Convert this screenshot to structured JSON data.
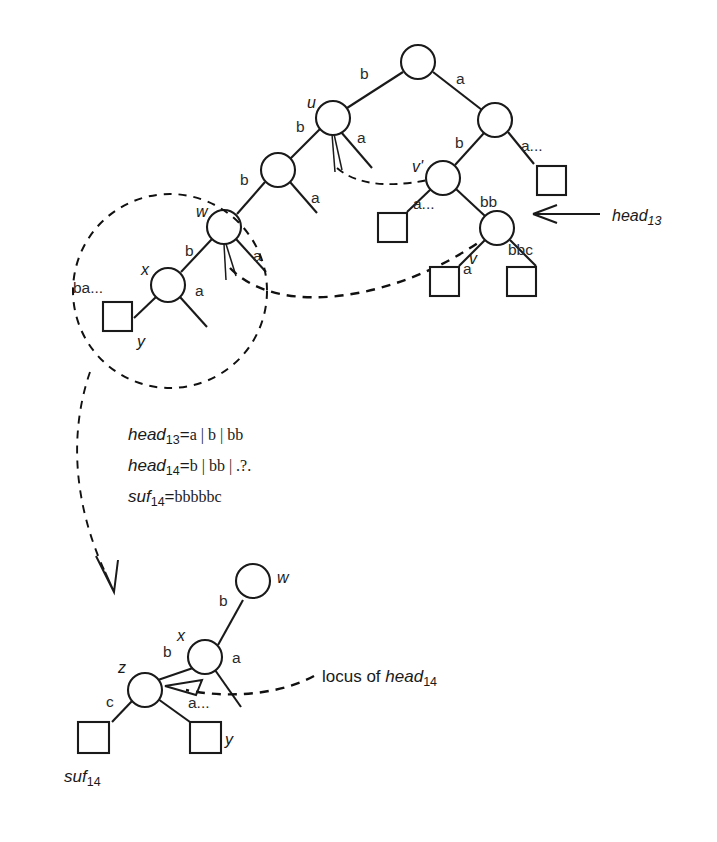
{
  "figure": {
    "background": "#ffffff",
    "ink": "#1a1a1a"
  },
  "upper_tree": {
    "node_labels": {
      "u": "u",
      "w": "w",
      "v_prime": "v'",
      "v": "v",
      "x": "x",
      "y": "y"
    },
    "edge_labels": {
      "root_left": "b",
      "root_right": "a",
      "u_left": "b",
      "u_right": "a",
      "mid_left": "b",
      "mid_right": "a",
      "w_left": "b",
      "w_right": "a",
      "x_left": "ba...",
      "x_right": "a",
      "right_child_left": "b",
      "right_child_right": "a...",
      "vprime_left": "a...",
      "vprime_right": "bb",
      "v_left": "a",
      "v_right": "bbc"
    }
  },
  "annotations": {
    "head13_arrow_label_name": "head",
    "head13_arrow_label_sub": "13",
    "locus_prefix": "locus of ",
    "locus_name": "head",
    "locus_sub": "14"
  },
  "formulas": [
    {
      "name": "head",
      "sub": "13",
      "eq": "=",
      "value": "a | b | bb"
    },
    {
      "name": "head",
      "sub": "14",
      "eq": "=",
      "value": "b | bb | .?."
    },
    {
      "name": "suf",
      "sub": "14",
      "eq": "=",
      "value": "bbbbbc"
    }
  ],
  "lower_tree": {
    "node_labels": {
      "w": "w",
      "x": "x",
      "z": "z",
      "y": "y"
    },
    "edge_labels": {
      "x_to_w": "b",
      "x_left": "b",
      "x_right": "a",
      "z_left": "c",
      "z_right": "a..."
    },
    "leaf_caption_name": "suf",
    "leaf_caption_sub": "14"
  }
}
